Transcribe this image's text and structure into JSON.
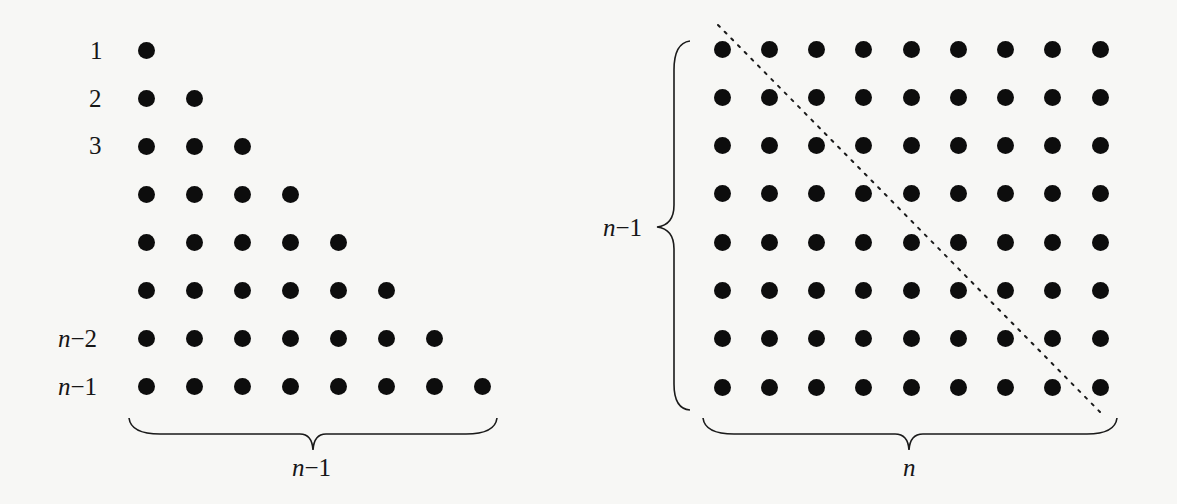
{
  "figure": {
    "left_panel": {
      "description": "Triangular arrangement of dots: row k has k dots, rows 1..n-1",
      "row_labels": [
        {
          "row": 1,
          "text": "1"
        },
        {
          "row": 2,
          "text": "2"
        },
        {
          "row": 3,
          "text": "3"
        },
        {
          "row": 7,
          "text_var": "n",
          "text_rest": "−2"
        },
        {
          "row": 8,
          "text_var": "n",
          "text_rest": "−1"
        }
      ],
      "rows_dot_counts": [
        1,
        2,
        3,
        4,
        5,
        6,
        7,
        8
      ],
      "bottom_brace_label": {
        "var": "n",
        "rest": "−1"
      }
    },
    "right_panel": {
      "description": "Rectangular grid of dots (n-1 rows by n columns) split by a dotted diagonal into two triangles",
      "rows": 8,
      "columns": 9,
      "left_brace_label": {
        "var": "n",
        "rest": "−1"
      },
      "bottom_brace_label": {
        "var": "n",
        "rest": ""
      },
      "diagonal": "dotted"
    }
  },
  "colors": {
    "background": "#f7f7f5",
    "ink": "#0d0d0d"
  }
}
